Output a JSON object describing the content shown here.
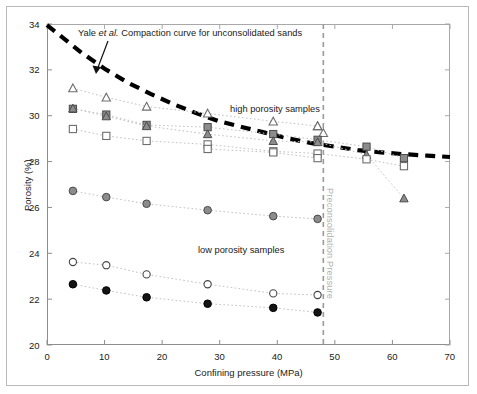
{
  "chart_data": {
    "type": "scatter",
    "title": "",
    "xlabel": "Confining pressure (MPa)",
    "ylabel": "Porosity (%)",
    "xlim": [
      0,
      70
    ],
    "ylim": [
      20,
      34
    ],
    "xticks": [
      0,
      10,
      20,
      30,
      40,
      50,
      60,
      70
    ],
    "yticks": [
      20,
      22,
      24,
      26,
      28,
      30,
      32,
      34
    ],
    "grid": false,
    "legend_position": "none",
    "annotations": [
      {
        "name": "yale-curve-annotation",
        "text": "Yale ",
        "text_italic": "et al.",
        "text_rest": " Compaction curve for unconsolidated sands",
        "x": 12.5,
        "y": 33.2
      },
      {
        "name": "high-porosity-annotation",
        "text": "high porosity samples",
        "x": 35.5,
        "y": 31.1
      },
      {
        "name": "low-porosity-annotation",
        "text": "low porosity samples",
        "x": 31.5,
        "y": 24.0
      },
      {
        "name": "preconsolidation-pressure-label",
        "text": "Preconsolidation Pressure",
        "x": 48.0,
        "y": 28.0
      }
    ],
    "reference_lines": [
      {
        "name": "preconsolidation-pressure-line",
        "orientation": "vertical",
        "x": 48.0,
        "style": "dashed",
        "color": "#9a9a9a"
      }
    ],
    "series": [
      {
        "name": "Yale et al. compaction curve for unconsolidated sands",
        "marker": "none",
        "line": "thick-dashed",
        "color": "#000000",
        "x": [
          0.0,
          3.0,
          6.0,
          10.0,
          14.0,
          18.0,
          22.0,
          26.0,
          30.0,
          34.0,
          38.0,
          42.0,
          46.0,
          50.0,
          54.0,
          58.0,
          62.0,
          66.0,
          70.0
        ],
        "y": [
          33.95,
          33.35,
          32.75,
          32.05,
          31.45,
          30.95,
          30.5,
          30.1,
          29.75,
          29.5,
          29.25,
          29.0,
          28.8,
          28.65,
          28.5,
          28.4,
          28.32,
          28.26,
          28.2
        ]
      },
      {
        "name": "high porosity - open triangle",
        "marker": "open-triangle",
        "line": "dotted",
        "color": "#8a8a8a",
        "x": [
          4.5,
          10.3,
          17.3,
          27.9,
          39.3,
          47.0
        ],
        "y": [
          31.2,
          30.8,
          30.4,
          30.1,
          29.75,
          29.55
        ]
      },
      {
        "name": "high porosity - open triangle continued",
        "marker": "open-triangle",
        "line": "dotted",
        "color": "#8a8a8a",
        "x": [
          47.0,
          48.0
        ],
        "y": [
          29.55,
          29.25
        ]
      },
      {
        "name": "high porosity - gray filled square",
        "marker": "filled-square",
        "line": "dotted",
        "color": "#808080",
        "x": [
          4.5,
          10.3,
          17.3,
          27.9,
          39.3,
          47.0,
          55.5,
          62.0
        ],
        "y": [
          30.3,
          30.05,
          29.6,
          29.5,
          29.2,
          28.95,
          28.65,
          28.15
        ]
      },
      {
        "name": "high porosity - gray filled triangle",
        "marker": "filled-triangle",
        "line": "dotted",
        "color": "#808080",
        "x": [
          4.5,
          10.3,
          17.3,
          27.9,
          39.3,
          47.0,
          55.5,
          62.0
        ],
        "y": [
          30.32,
          29.98,
          29.55,
          29.2,
          28.9,
          28.85,
          28.3,
          26.4
        ]
      },
      {
        "name": "high porosity - open square",
        "marker": "open-square",
        "line": "dotted",
        "color": "#8a8a8a",
        "x": [
          4.5,
          10.3,
          17.3,
          27.9,
          39.3,
          47.0,
          55.5,
          62.0
        ],
        "y": [
          29.42,
          29.12,
          28.9,
          28.75,
          28.45,
          28.35,
          28.1,
          27.8
        ]
      },
      {
        "name": "high porosity - open square lower",
        "marker": "open-square",
        "line": "dotted",
        "color": "#8a8a8a",
        "x": [
          27.9,
          39.3,
          47.0
        ],
        "y": [
          28.55,
          28.4,
          28.15
        ]
      },
      {
        "name": "low porosity - gray filled circle",
        "marker": "filled-circle",
        "line": "dotted",
        "color": "#808080",
        "x": [
          4.5,
          10.3,
          17.3,
          27.9,
          39.3,
          47.0
        ],
        "y": [
          26.72,
          26.45,
          26.16,
          25.88,
          25.62,
          25.5
        ]
      },
      {
        "name": "low porosity - open circle",
        "marker": "open-circle",
        "line": "dotted",
        "color": "#555555",
        "x": [
          4.5,
          10.3,
          17.3,
          27.9,
          39.3,
          47.0
        ],
        "y": [
          23.62,
          23.48,
          23.08,
          22.65,
          22.25,
          22.18
        ]
      },
      {
        "name": "low porosity - black filled circle",
        "marker": "black-circle",
        "line": "dotted",
        "color": "#111111",
        "x": [
          4.5,
          10.3,
          17.3,
          27.9,
          39.3,
          47.0
        ],
        "y": [
          22.65,
          22.38,
          22.08,
          21.8,
          21.62,
          21.42
        ]
      }
    ]
  },
  "figure": {
    "background": "#ffffff",
    "frame_color": "#b9b9b9",
    "axis_color": "#8d8d8d"
  }
}
